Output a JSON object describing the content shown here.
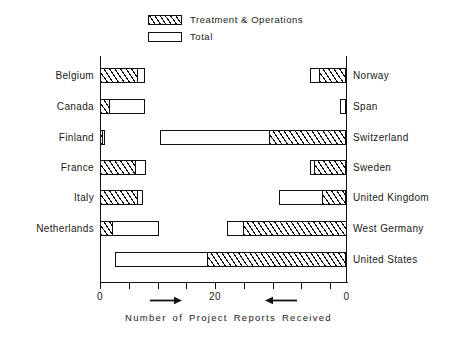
{
  "legend": {
    "items": [
      {
        "label": "Treatment & Operations",
        "swatch": "hatched",
        "name": "legend-swatch-treatment"
      },
      {
        "label": "Total",
        "swatch": "white",
        "name": "legend-swatch-total"
      }
    ]
  },
  "axis": {
    "title": "Number of Project Reports Received",
    "tick_labels": [
      "0",
      "20",
      "0"
    ],
    "tick_label_values": [
      0,
      20,
      0
    ],
    "left_arrow": "right-arrow-icon",
    "right_arrow": "left-arrow-icon"
  },
  "chart_data": {
    "type": "bar",
    "orientation": "horizontal",
    "layout": "two-panel mirrored (left panel grows rightward from 0; right panel grows leftward from 0)",
    "title": "",
    "xlabel": "Number of Project Reports Received",
    "ylabel": "",
    "xlim": [
      0,
      43
    ],
    "xticks": [
      0,
      5,
      10,
      15,
      20,
      25,
      30,
      35,
      40
    ],
    "labeled_xticks": [
      0,
      20,
      0
    ],
    "grid": false,
    "legend_position": "top-center",
    "series": [
      {
        "name": "Treatment & Operations",
        "fill": "hatched"
      },
      {
        "name": "Total",
        "fill": "white"
      }
    ],
    "panels": [
      {
        "side": "left",
        "baseline": 0,
        "categories": [
          "Belgium",
          "Canada",
          "Finland",
          "France",
          "Italy",
          "Netherlands"
        ],
        "treatment_and_operations": [
          6.6,
          1.7,
          0.6,
          6.2,
          6.6,
          2.2
        ],
        "total": [
          7.8,
          7.8,
          0.9,
          8.0,
          7.4,
          10.2
        ]
      },
      {
        "side": "right",
        "baseline": 0,
        "categories": [
          "Norway",
          "Span",
          "Switzerland",
          "Sweden",
          "United Kingdom",
          "West Germany",
          "United States"
        ],
        "treatment_and_operations": [
          4.7,
          0.0,
          13.4,
          5.6,
          4.3,
          18.0,
          24.2
        ],
        "total": [
          6.4,
          1.2,
          32.5,
          6.4,
          11.8,
          20.8,
          40.2
        ]
      }
    ]
  },
  "bars": {
    "left": [
      {
        "category": "Belgium",
        "hatch_start": 0,
        "hatch_end": 6.6,
        "total_end": 7.8
      },
      {
        "category": "Canada",
        "hatch_start": 0,
        "hatch_end": 1.7,
        "total_end": 7.8
      },
      {
        "category": "Finland",
        "hatch_start": 0,
        "hatch_end": 0.6,
        "total_end": 0.9
      },
      {
        "category": "France",
        "hatch_start": 0,
        "hatch_end": 6.2,
        "total_end": 8.0
      },
      {
        "category": "Italy",
        "hatch_start": 0,
        "hatch_end": 6.6,
        "total_end": 7.4
      },
      {
        "category": "Netherlands",
        "hatch_start": 0,
        "hatch_end": 2.2,
        "total_end": 10.2
      }
    ],
    "right": [
      {
        "category": "Norway",
        "hatch_start": 0,
        "hatch_end": 4.7,
        "total_end": 6.4
      },
      {
        "category": "Span",
        "hatch_start": 0,
        "hatch_end": 0.0,
        "total_end": 1.2
      },
      {
        "category": "Switzerland",
        "hatch_start": 0,
        "hatch_end": 13.4,
        "total_end": 32.5
      },
      {
        "category": "Sweden",
        "hatch_start": 0,
        "hatch_end": 5.6,
        "total_end": 6.4
      },
      {
        "category": "United Kingdom",
        "hatch_start": 0,
        "hatch_end": 4.3,
        "total_end": 11.8
      },
      {
        "category": "West Germany",
        "hatch_start": 0,
        "hatch_end": 18.0,
        "total_end": 20.8
      },
      {
        "category": "United States",
        "hatch_start": 0,
        "hatch_end": 24.2,
        "total_end": 40.2
      }
    ]
  }
}
